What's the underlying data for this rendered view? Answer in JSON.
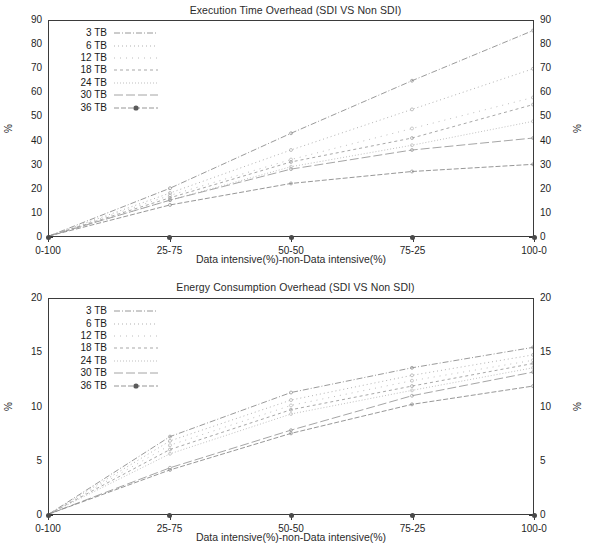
{
  "charts": [
    {
      "title": "Execution Time Overhead (SDI VS Non SDI)",
      "xlabel": "Data intensive(%)-non-Data intensive(%)",
      "ylabel_left": "%",
      "ylabel_right": "%",
      "yticks": [
        "90",
        "80",
        "70",
        "60",
        "50",
        "40",
        "30",
        "20",
        "10",
        "0"
      ],
      "xticks": [
        "0-100",
        "25-75",
        "50-50",
        "75-25",
        "100-0"
      ],
      "legend": [
        {
          "label": "3 TB",
          "style": "dashdot",
          "marker": "none"
        },
        {
          "label": "6 TB",
          "style": "dotted",
          "marker": "none"
        },
        {
          "label": "12 TB",
          "style": "sparsedot",
          "marker": "none"
        },
        {
          "label": "18 TB",
          "style": "shortdash",
          "marker": "none"
        },
        {
          "label": "24 TB",
          "style": "finedot",
          "marker": "none"
        },
        {
          "label": "30 TB",
          "style": "longdash",
          "marker": "none"
        },
        {
          "label": "36 TB",
          "style": "solidmarker",
          "marker": "circle"
        }
      ]
    },
    {
      "title": "Energy Consumption Overhead (SDI VS Non SDI)",
      "xlabel": "Data intensive(%)-non-Data intensive(%)",
      "ylabel_left": "%",
      "ylabel_right": "%",
      "yticks": [
        "20",
        "15",
        "10",
        "5",
        "0"
      ],
      "xticks": [
        "0-100",
        "25-75",
        "50-50",
        "75-25",
        "100-0"
      ],
      "legend": [
        {
          "label": "3 TB",
          "style": "dashdot",
          "marker": "none"
        },
        {
          "label": "6 TB",
          "style": "dotted",
          "marker": "none"
        },
        {
          "label": "12 TB",
          "style": "sparsedot",
          "marker": "none"
        },
        {
          "label": "18 TB",
          "style": "shortdash",
          "marker": "none"
        },
        {
          "label": "24 TB",
          "style": "finedot",
          "marker": "none"
        },
        {
          "label": "30 TB",
          "style": "longdash",
          "marker": "none"
        },
        {
          "label": "36 TB",
          "style": "solidmarker",
          "marker": "circle"
        }
      ]
    }
  ],
  "chart_data": [
    {
      "type": "line",
      "title": "Execution Time Overhead (SDI VS Non SDI)",
      "xlabel": "Data intensive(%)-non-Data intensive(%)",
      "ylabel": "%",
      "categories": [
        "0-100",
        "25-75",
        "50-50",
        "75-25",
        "100-0"
      ],
      "ylim": [
        0,
        90
      ],
      "ytick_values": [
        0,
        10,
        20,
        30,
        40,
        50,
        60,
        70,
        80,
        90
      ],
      "grid": false,
      "legend_position": "top-left",
      "dual_y_axis": true,
      "series": [
        {
          "name": "3 TB",
          "values": [
            0,
            20,
            43,
            65,
            86
          ]
        },
        {
          "name": "6 TB",
          "values": [
            0,
            18,
            36,
            53,
            70
          ]
        },
        {
          "name": "12 TB",
          "values": [
            0,
            17,
            32,
            45,
            58
          ]
        },
        {
          "name": "18 TB",
          "values": [
            0,
            16,
            31,
            41,
            55
          ]
        },
        {
          "name": "24 TB",
          "values": [
            0,
            15,
            29,
            38,
            48
          ]
        },
        {
          "name": "30 TB",
          "values": [
            0,
            15,
            28,
            36,
            41
          ]
        },
        {
          "name": "36 TB",
          "values": [
            0,
            13,
            22,
            27,
            30
          ]
        }
      ]
    },
    {
      "type": "line",
      "title": "Energy Consumption Overhead (SDI VS Non SDI)",
      "xlabel": "Data intensive(%)-non-Data intensive(%)",
      "ylabel": "%",
      "categories": [
        "0-100",
        "25-75",
        "50-50",
        "75-25",
        "100-0"
      ],
      "ylim": [
        0,
        20
      ],
      "ytick_values": [
        0,
        5,
        10,
        15,
        20
      ],
      "grid": false,
      "legend_position": "top-left",
      "dual_y_axis": true,
      "series": [
        {
          "name": "3 TB",
          "values": [
            0,
            7.2,
            11.3,
            13.6,
            15.5
          ]
        },
        {
          "name": "6 TB",
          "values": [
            0,
            6.8,
            10.6,
            12.9,
            14.8
          ]
        },
        {
          "name": "12 TB",
          "values": [
            0,
            6.4,
            10.1,
            12.4,
            14.3
          ]
        },
        {
          "name": "18 TB",
          "values": [
            0,
            6.0,
            9.7,
            11.9,
            14.0
          ]
        },
        {
          "name": "24 TB",
          "values": [
            0,
            5.6,
            9.3,
            11.5,
            13.6
          ]
        },
        {
          "name": "30 TB",
          "values": [
            0,
            4.3,
            7.8,
            11.0,
            13.2
          ]
        },
        {
          "name": "36 TB",
          "values": [
            0,
            4.1,
            7.5,
            10.2,
            11.9
          ]
        }
      ]
    }
  ]
}
